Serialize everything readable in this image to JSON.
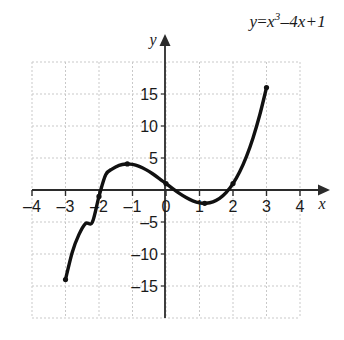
{
  "figure": {
    "title": "",
    "equation": {
      "lhs": "y",
      "equals": "=",
      "base": "x",
      "exponent": "3",
      "rest": "–4x+1",
      "plain": "y=x³–4x+1"
    },
    "axis_names": {
      "x": "x",
      "y": "y"
    },
    "colors": {
      "curve": "#111111",
      "axis": "#2b2b2b",
      "grid": "#c9c9c9",
      "background": "#ffffff",
      "text": "#1a1a1a"
    }
  },
  "chart_data": {
    "type": "line",
    "xlabel": "x",
    "ylabel": "y",
    "xlim": [
      -4,
      4
    ],
    "ylim": [
      -20,
      20
    ],
    "xticks": [
      -4,
      -3,
      -2,
      -1,
      0,
      1,
      2,
      3,
      4
    ],
    "xtick_labels": [
      "–4",
      "–3",
      "–2",
      "–1",
      "0",
      "1",
      "2",
      "3",
      "4"
    ],
    "yticks": [
      -15,
      -10,
      -5,
      5,
      10,
      15
    ],
    "ytick_labels": [
      "–15",
      "–10",
      "–5",
      "5",
      "10",
      "15"
    ],
    "grid": true,
    "grid_x_step": 1,
    "grid_y_step": 5,
    "legend": null,
    "series": [
      {
        "name": "y=x³–4x+1",
        "x": [
          -3,
          -2.8,
          -2.6,
          -2.4,
          -2.2,
          -2,
          -1.8,
          -1.6,
          -1.4,
          -1.2,
          -1,
          -0.8,
          -0.6,
          -0.4,
          -0.2,
          0,
          0.2,
          0.4,
          0.6,
          0.8,
          1,
          1.2,
          1.4,
          1.6,
          1.8,
          2,
          2.2,
          2.4,
          2.6,
          2.8,
          3
        ],
        "y": [
          -14,
          -9.752,
          -6.976,
          -5.224,
          -5.048,
          -1,
          2.368,
          3.304,
          3.856,
          4.072,
          4,
          3.688,
          3.184,
          2.536,
          1.792,
          1,
          0.208,
          -0.536,
          -1.184,
          -1.688,
          -2,
          -2.072,
          -1.856,
          -1.304,
          -0.368,
          1,
          2.848,
          5.224,
          8.176,
          11.752,
          16
        ],
        "endpoints": [
          {
            "x": -3,
            "y": -14,
            "marker": "dot"
          },
          {
            "x": 3,
            "y": 16,
            "marker": "dot"
          }
        ],
        "marked_points": [
          {
            "x": -2,
            "y": -1,
            "marker": "dot"
          },
          {
            "x": -1.155,
            "y": 4.079,
            "marker": "dot"
          },
          {
            "x": 0,
            "y": 1,
            "marker": "dot"
          },
          {
            "x": 1.155,
            "y": -2.079,
            "marker": "dot"
          },
          {
            "x": 2,
            "y": 1,
            "marker": "dot"
          }
        ]
      }
    ]
  }
}
